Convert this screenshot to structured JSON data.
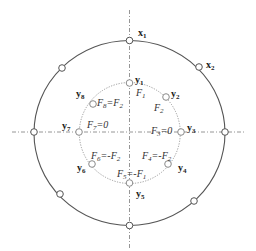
{
  "diagram": {
    "outer_nodes": [
      {
        "id": "x1",
        "label": "x",
        "sub": "1"
      },
      {
        "id": "x2",
        "label": "x",
        "sub": "2"
      }
    ],
    "inner_nodes": [
      {
        "id": "y1",
        "label": "y",
        "sub": "1"
      },
      {
        "id": "y2",
        "label": "y",
        "sub": "2"
      },
      {
        "id": "y3",
        "label": "y",
        "sub": "3"
      },
      {
        "id": "y4",
        "label": "y",
        "sub": "4"
      },
      {
        "id": "y5",
        "label": "y",
        "sub": "5"
      },
      {
        "id": "y6",
        "label": "y",
        "sub": "6"
      },
      {
        "id": "y7",
        "label": "y",
        "sub": "7"
      },
      {
        "id": "y8",
        "label": "y",
        "sub": "8"
      }
    ],
    "forces": [
      {
        "id": "F1",
        "base": "F",
        "sub": "1",
        "eq": ""
      },
      {
        "id": "F2",
        "base": "F",
        "sub": "2",
        "eq": ""
      },
      {
        "id": "F3",
        "base": "F",
        "sub": "3",
        "eq": "=0"
      },
      {
        "id": "F4",
        "base": "F",
        "sub": "4",
        "eq": "=-F",
        "eq_sub": "2"
      },
      {
        "id": "F5",
        "base": "F",
        "sub": "5",
        "eq": "=-F",
        "eq_sub": "1"
      },
      {
        "id": "F6",
        "base": "F",
        "sub": "6",
        "eq": "=-F",
        "eq_sub": "2"
      },
      {
        "id": "F7",
        "base": "F",
        "sub": "7",
        "eq": "=0"
      },
      {
        "id": "F8",
        "base": "F",
        "sub": "8",
        "eq": "=F",
        "eq_sub": "2"
      }
    ]
  }
}
